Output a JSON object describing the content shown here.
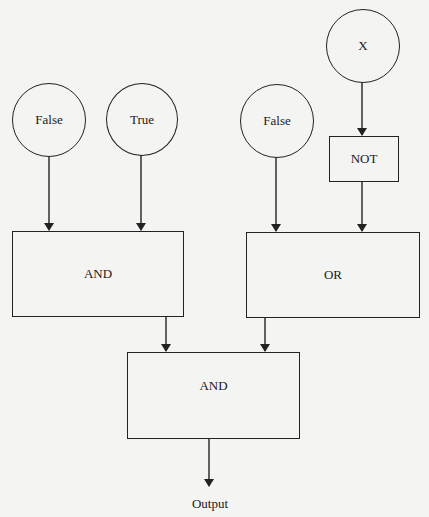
{
  "diagram": {
    "type": "logic-circuit-flow",
    "inputs": [
      {
        "id": "in1",
        "label": "False"
      },
      {
        "id": "in2",
        "label": "True"
      },
      {
        "id": "in3",
        "label": "False"
      },
      {
        "id": "in4",
        "label": "X"
      }
    ],
    "gates": [
      {
        "id": "not1",
        "label": "NOT"
      },
      {
        "id": "and1",
        "label": "AND"
      },
      {
        "id": "or1",
        "label": "OR"
      },
      {
        "id": "and2",
        "label": "AND"
      }
    ],
    "output": {
      "label": "Output"
    },
    "edges": [
      {
        "from": "in1",
        "to": "and1"
      },
      {
        "from": "in2",
        "to": "and1"
      },
      {
        "from": "in4",
        "to": "not1"
      },
      {
        "from": "in3",
        "to": "or1"
      },
      {
        "from": "not1",
        "to": "or1"
      },
      {
        "from": "and1",
        "to": "and2"
      },
      {
        "from": "or1",
        "to": "and2"
      },
      {
        "from": "and2",
        "to": "output"
      }
    ]
  },
  "colors": {
    "stroke": "#222222",
    "background": "#f4f4f2"
  }
}
